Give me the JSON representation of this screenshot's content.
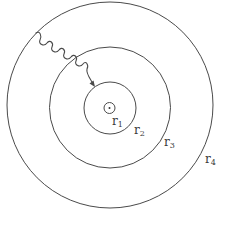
{
  "diagram": {
    "center": {
      "x": 110,
      "y": 107
    },
    "stroke_color": "#4a4a4a",
    "background_color": "#ffffff",
    "rings": [
      {
        "name": "r1",
        "radius": 5.5
      },
      {
        "name": "r2",
        "radius": 26
      },
      {
        "name": "r3",
        "radius": 60
      },
      {
        "name": "r4",
        "radius": 103
      }
    ],
    "labels": [
      {
        "base": "r",
        "sub": "1",
        "x": 112,
        "y": 115
      },
      {
        "base": "r",
        "sub": "2",
        "x": 134,
        "y": 124
      },
      {
        "base": "r",
        "sub": "3",
        "x": 164,
        "y": 136
      },
      {
        "base": "r",
        "sub": "4",
        "x": 205,
        "y": 153
      }
    ],
    "photon": {
      "label": "wavy arrow (photon) entering from outer ring toward inner ring",
      "start": {
        "x": 36,
        "y": 33
      },
      "end": {
        "x": 93,
        "y": 86
      }
    }
  }
}
